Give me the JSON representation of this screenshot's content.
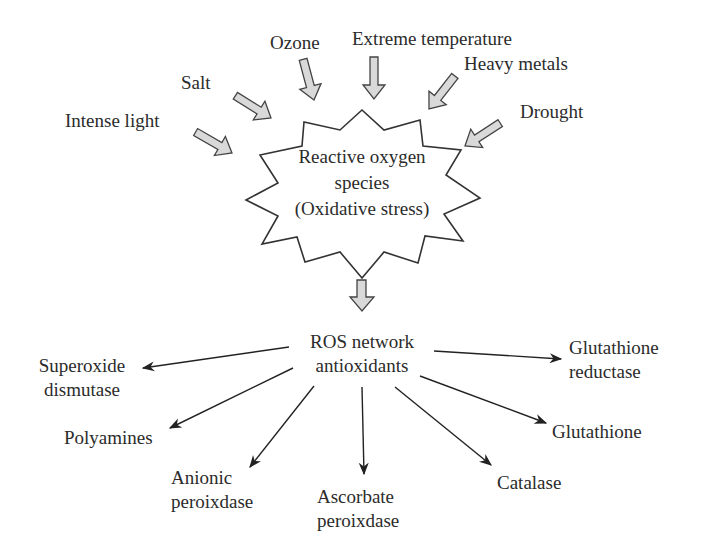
{
  "stressors": [
    {
      "id": "intense-light",
      "label": "Intense light"
    },
    {
      "id": "salt",
      "label": "Salt"
    },
    {
      "id": "ozone",
      "label": "Ozone"
    },
    {
      "id": "extreme-temperature",
      "label": "Extreme temperature"
    },
    {
      "id": "heavy-metals",
      "label": "Heavy metals"
    },
    {
      "id": "drought",
      "label": "Drought"
    }
  ],
  "center": {
    "line1": "Reactive oxygen",
    "line2": "species",
    "line3": "(Oxidative stress)"
  },
  "network": {
    "line1": "ROS network",
    "line2": "antioxidants"
  },
  "antioxidants": [
    {
      "id": "superoxide-dismutase",
      "line1": "Superoxide",
      "line2": "dismutase"
    },
    {
      "id": "polyamines",
      "line1": "Polyamines",
      "line2": ""
    },
    {
      "id": "anionic-peroxidase",
      "line1": "Anionic",
      "line2": "peroixdase"
    },
    {
      "id": "ascorbate-peroxidase",
      "line1": "Ascorbate",
      "line2": "peroixdase"
    },
    {
      "id": "catalase",
      "line1": "Catalase",
      "line2": ""
    },
    {
      "id": "glutathione",
      "line1": "Glutathione",
      "line2": ""
    },
    {
      "id": "glutathione-reductase",
      "line1": "Glutathione",
      "line2": "reductase"
    }
  ],
  "colors": {
    "block_arrow_fill": "#d9d9d9",
    "stroke": "#333333",
    "text": "#2b2b2b"
  }
}
